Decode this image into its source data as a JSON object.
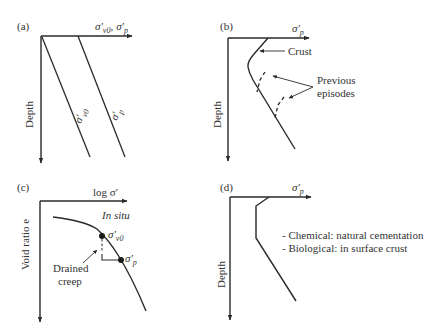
{
  "panels": {
    "a": {
      "label": "(a)",
      "x_axis_label": "σ′v0, σ′p",
      "x_axis_label_parts": {
        "s1": "σ′",
        "s1_sub": "v0",
        "sep": ",",
        "s2": "σ′",
        "s2_sub": "p"
      },
      "y_axis_label": "Depth",
      "lines": [
        {
          "name": "σ′v0",
          "sym": "σ′",
          "sub": "v0"
        },
        {
          "name": "σ′p",
          "sym": "σ′",
          "sub": "p"
        }
      ]
    },
    "b": {
      "label": "(b)",
      "x_axis_label": "σ′p",
      "x_sym": "σ′",
      "x_sub": "p",
      "y_axis_label": "Depth",
      "annotations": {
        "crust": "Crust",
        "previous_1": "Previous",
        "previous_2": "episodes"
      }
    },
    "c": {
      "label": "(c)",
      "x_axis_label": "log σ′",
      "y_axis_label": "Void ratio e",
      "annotations": {
        "in_situ": "In situ",
        "sv0_sym": "σ′",
        "sv0_sub": "v0",
        "sp_sym": "σ′",
        "sp_sub": "p",
        "drained_1": "Drained",
        "drained_2": "creep"
      }
    },
    "d": {
      "label": "(d)",
      "x_axis_label": "σ′p",
      "x_sym": "σ′",
      "x_sub": "p",
      "y_axis_label": "Depth",
      "notes": [
        "- Chemical: natural cementation",
        "- Biological: in surface crust"
      ]
    }
  },
  "colors": {
    "line": "#2a2a2a",
    "text": "#333333",
    "background": "#ffffff"
  }
}
